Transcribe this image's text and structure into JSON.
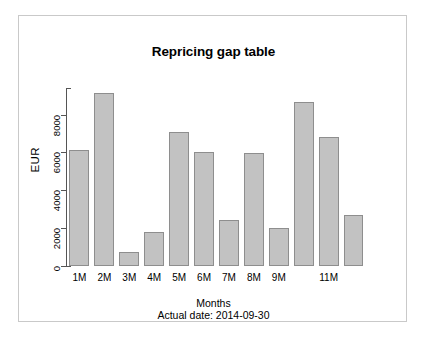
{
  "chart_data": {
    "type": "bar",
    "title": "Repricing gap table",
    "xlabel": "Months",
    "ylabel": "EUR",
    "subtitle": "Actual date:  2014-09-30",
    "categories": [
      "1M",
      "2M",
      "3M",
      "4M",
      "5M",
      "6M",
      "7M",
      "8M",
      "9M",
      "",
      "11M",
      ""
    ],
    "values": [
      6100,
      9150,
      750,
      1800,
      7100,
      6000,
      2450,
      5950,
      2000,
      8650,
      6800,
      2700
    ],
    "ytick_labels": [
      "0",
      "2000",
      "4000",
      "6000",
      "8000"
    ],
    "ytick_values": [
      0,
      2000,
      4000,
      6000,
      8000
    ],
    "ylim": [
      0,
      9400
    ],
    "grid": false,
    "legend": "none",
    "bar_fill_color": "#c2c2c2",
    "bar_border_color": "#8e8e8e",
    "axis_color": "#555555",
    "background_color": "#ffffff"
  },
  "frame": {
    "border_color": "#c9c9c9"
  }
}
